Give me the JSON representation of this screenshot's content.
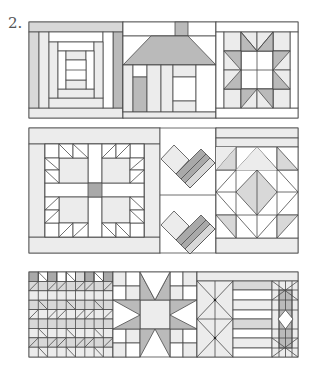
{
  "figure": {
    "number_label": "2.",
    "colors": {
      "line": "#4a4a4a",
      "white": "#ffffff",
      "light": "#ebebeb",
      "mid": "#d6d6d6",
      "dark": "#b8b8b8",
      "darker": "#a8a8a8"
    },
    "rows": [
      {
        "name": "row-1",
        "blocks": [
          "log-cabin",
          "house",
          "sawtooth-star"
        ]
      },
      {
        "name": "row-2",
        "blocks": [
          "bear-paw",
          "hearts",
          "square-in-square"
        ]
      },
      {
        "name": "row-3",
        "blocks": [
          "flying-geese-grid",
          "eight-point-star",
          "cross-and-stripes"
        ]
      }
    ]
  }
}
